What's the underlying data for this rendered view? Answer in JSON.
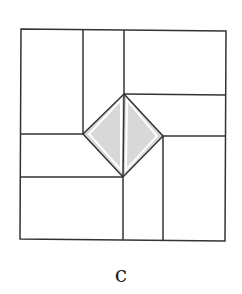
{
  "figure": {
    "caption": "c",
    "colors": {
      "stroke": "#333333",
      "fill_shade": "#d8d8d8",
      "background": "#ffffff"
    },
    "outer_square": {
      "points": "21,29 226,31 225,241 20,239"
    },
    "diamond": {
      "top": [
        124,
        94
      ],
      "right": [
        163,
        136
      ],
      "bottom": [
        123,
        177
      ],
      "left": [
        83,
        134
      ]
    },
    "lines": [
      {
        "name": "top-left-vertical",
        "x1": 83,
        "y1": 29,
        "x2": 83,
        "y2": 134
      },
      {
        "name": "top-center-vertical",
        "x1": 124,
        "y1": 30,
        "x2": 124,
        "y2": 94
      },
      {
        "name": "right-upper-horizontal",
        "x1": 124,
        "y1": 94,
        "x2": 226,
        "y2": 95
      },
      {
        "name": "right-lower-horizontal",
        "x1": 163,
        "y1": 136,
        "x2": 225,
        "y2": 136
      },
      {
        "name": "right-vertical",
        "x1": 163,
        "y1": 136,
        "x2": 163,
        "y2": 240
      },
      {
        "name": "bottom-center-vertical",
        "x1": 123,
        "y1": 177,
        "x2": 123,
        "y2": 240
      },
      {
        "name": "left-lower-horizontal",
        "x1": 20,
        "y1": 177,
        "x2": 123,
        "y2": 177
      },
      {
        "name": "left-upper-horizontal",
        "x1": 20,
        "y1": 134,
        "x2": 83,
        "y2": 134
      },
      {
        "name": "diamond-split",
        "x1": 124,
        "y1": 94,
        "x2": 123,
        "y2": 177
      }
    ]
  }
}
